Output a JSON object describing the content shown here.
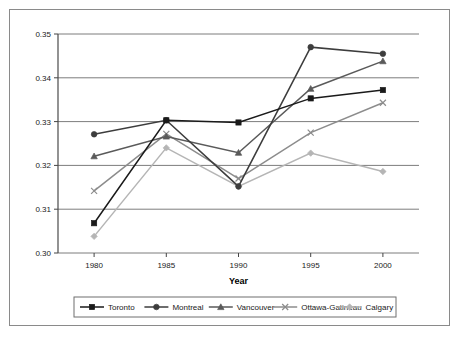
{
  "chart_data": {
    "type": "line",
    "title": "",
    "xlabel": "Year",
    "ylabel": "",
    "categories": [
      "1980",
      "1985",
      "1990",
      "1995",
      "2000"
    ],
    "x": [
      1980,
      1985,
      1990,
      1995,
      2000
    ],
    "xlim": [
      1977.5,
      2002.5
    ],
    "ylim": [
      0.3,
      0.35
    ],
    "yticks": [
      "0.30",
      "0.31",
      "0.32",
      "0.33",
      "0.34",
      "0.35"
    ],
    "ytick_values": [
      0.3,
      0.31,
      0.32,
      0.33,
      0.34,
      0.35
    ],
    "grid": "horizontal",
    "legend_position": "bottom",
    "series": [
      {
        "name": "Toronto",
        "marker": "square",
        "color": "#1a1a1a",
        "values": [
          0.3068,
          0.3303,
          0.3298,
          0.3353,
          0.3372
        ]
      },
      {
        "name": "Montreal",
        "marker": "circle",
        "color": "#3d3d3d",
        "values": [
          0.3271,
          0.3303,
          0.3152,
          0.347,
          0.3455
        ]
      },
      {
        "name": "Vancouver",
        "marker": "triangle",
        "color": "#5a5a5a",
        "values": [
          0.3221,
          0.3266,
          0.3229,
          0.3375,
          0.3438
        ]
      },
      {
        "name": "Ottawa-Gatineau",
        "marker": "x",
        "color": "#8c8c8c",
        "values": [
          0.3142,
          0.3272,
          0.317,
          0.3275,
          0.3343
        ]
      },
      {
        "name": "Calgary",
        "marker": "diamond",
        "color": "#b5b5b5",
        "values": [
          0.3038,
          0.324,
          0.3152,
          0.3228,
          0.3186
        ]
      }
    ]
  }
}
